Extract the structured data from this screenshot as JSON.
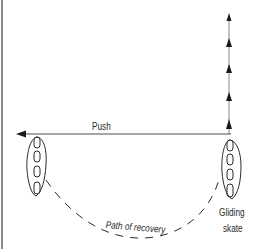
{
  "diagram": {
    "labels": {
      "push": "Push",
      "path_of_recovery": "Path of recovery",
      "gliding": "Gliding",
      "skate": "skate"
    },
    "elements": {
      "push_arrow": {
        "direction": "left",
        "from_x": 231,
        "to_x": 17,
        "y": 134
      },
      "glide_direction_arrows": {
        "direction": "up",
        "x": 229,
        "count": 5
      },
      "left_skate": "pushing skate (after push)",
      "right_skate": "gliding skate",
      "recovery_path": "dashed arc from left skate back to gliding skate"
    },
    "colors": {
      "line": "#2a2a2a",
      "border": "#8a8a8a",
      "background": "#ffffff"
    }
  }
}
